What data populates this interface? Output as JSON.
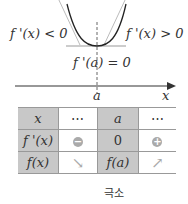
{
  "graph": {
    "left_label": "f '(x) < 0",
    "right_label": "f '(x) > 0",
    "bottom_label": "f '(a) = 0",
    "axis_point_label": "a",
    "axis_label": "x"
  },
  "table": {
    "rows": [
      {
        "header": "x",
        "cells": [
          "⋯",
          "a",
          "⋯"
        ]
      },
      {
        "header": "f '(x)",
        "cells": [
          "−",
          "0",
          "+"
        ]
      },
      {
        "header": "f(x)",
        "cells": [
          "↘",
          "f(a)",
          "↗"
        ]
      }
    ]
  },
  "caption": "극소",
  "colors": {
    "shade": "#c8c8c8",
    "curve": "#222222",
    "tangent": "#aaaaaa"
  }
}
